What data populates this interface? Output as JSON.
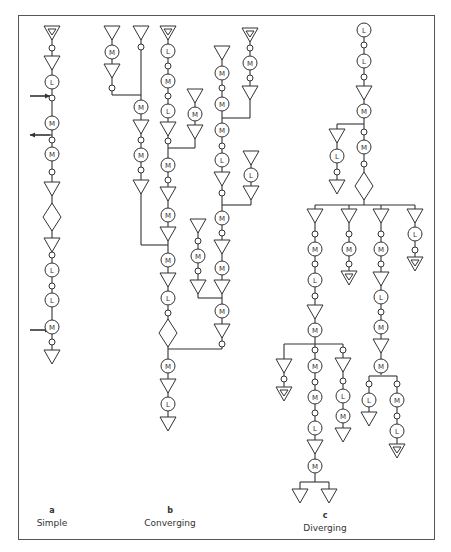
{
  "figure": {
    "panels": [
      {
        "id": "a",
        "letter": "a",
        "title": "Simple"
      },
      {
        "id": "b",
        "letter": "b",
        "title": "Converging"
      },
      {
        "id": "c",
        "letter": "c",
        "title": "Diverging"
      }
    ],
    "legend_symbols": {
      "M": "circle labeled M",
      "L": "circle labeled L",
      "triangle": "inverted triangle (storage)",
      "triangle_double": "inverted triangle with inner triangle",
      "diamond": "diamond (inspection)",
      "small_circle": "small circle (transport)",
      "arrow_in": "arrow entering line",
      "arrow_out": "arrow leaving line"
    }
  },
  "captions": {
    "a_letter": "a",
    "a_title": "Simple",
    "b_letter": "b",
    "b_title": "Converging",
    "c_letter": "c",
    "c_title": "Diverging"
  },
  "nodes": [
    {
      "t": "T2",
      "x": 52,
      "y": 32
    },
    {
      "t": "o",
      "x": 52,
      "y": 48
    },
    {
      "t": "T",
      "x": 52,
      "y": 62
    },
    {
      "t": "L",
      "x": 52,
      "y": 82
    },
    {
      "t": "o",
      "x": 52,
      "y": 98
    },
    {
      "t": "M",
      "x": 52,
      "y": 123
    },
    {
      "t": "o",
      "x": 52,
      "y": 140
    },
    {
      "t": "M",
      "x": 52,
      "y": 154
    },
    {
      "t": "o",
      "x": 52,
      "y": 172
    },
    {
      "t": "T",
      "x": 52,
      "y": 188
    },
    {
      "t": "D",
      "x": 52,
      "y": 217
    },
    {
      "t": "T",
      "x": 52,
      "y": 244
    },
    {
      "t": "o",
      "x": 52,
      "y": 255
    },
    {
      "t": "L",
      "x": 52,
      "y": 270
    },
    {
      "t": "o",
      "x": 52,
      "y": 286
    },
    {
      "t": "L",
      "x": 52,
      "y": 300
    },
    {
      "t": "M",
      "x": 52,
      "y": 327
    },
    {
      "t": "o",
      "x": 52,
      "y": 342
    },
    {
      "t": "T",
      "x": 52,
      "y": 356
    },
    {
      "t": "T",
      "x": 112,
      "y": 32
    },
    {
      "t": "M",
      "x": 112,
      "y": 52
    },
    {
      "t": "T",
      "x": 112,
      "y": 70
    },
    {
      "t": "o",
      "x": 112,
      "y": 88
    },
    {
      "t": "T",
      "x": 141,
      "y": 32
    },
    {
      "t": "o",
      "x": 141,
      "y": 47
    },
    {
      "t": "M",
      "x": 141,
      "y": 107
    },
    {
      "t": "T",
      "x": 141,
      "y": 126
    },
    {
      "t": "o",
      "x": 141,
      "y": 140
    },
    {
      "t": "M",
      "x": 141,
      "y": 155
    },
    {
      "t": "o",
      "x": 141,
      "y": 170
    },
    {
      "t": "T",
      "x": 141,
      "y": 186
    },
    {
      "t": "T2",
      "x": 168,
      "y": 32
    },
    {
      "t": "L",
      "x": 168,
      "y": 51
    },
    {
      "t": "o",
      "x": 168,
      "y": 66
    },
    {
      "t": "M",
      "x": 168,
      "y": 81
    },
    {
      "t": "o",
      "x": 168,
      "y": 96
    },
    {
      "t": "L",
      "x": 168,
      "y": 111
    },
    {
      "t": "T",
      "x": 168,
      "y": 128
    },
    {
      "t": "o",
      "x": 168,
      "y": 141
    },
    {
      "t": "M",
      "x": 168,
      "y": 165
    },
    {
      "t": "o",
      "x": 168,
      "y": 180
    },
    {
      "t": "T",
      "x": 168,
      "y": 193
    },
    {
      "t": "M",
      "x": 168,
      "y": 215
    },
    {
      "t": "T",
      "x": 168,
      "y": 233
    },
    {
      "t": "M",
      "x": 168,
      "y": 260
    },
    {
      "t": "T",
      "x": 168,
      "y": 279
    },
    {
      "t": "L",
      "x": 168,
      "y": 298
    },
    {
      "t": "o",
      "x": 168,
      "y": 313
    },
    {
      "t": "D",
      "x": 168,
      "y": 333
    },
    {
      "t": "M",
      "x": 168,
      "y": 366
    },
    {
      "t": "T",
      "x": 168,
      "y": 385
    },
    {
      "t": "L",
      "x": 168,
      "y": 404
    },
    {
      "t": "T",
      "x": 168,
      "y": 423
    },
    {
      "t": "T",
      "x": 195,
      "y": 95
    },
    {
      "t": "M",
      "x": 195,
      "y": 114
    },
    {
      "t": "T",
      "x": 195,
      "y": 131
    },
    {
      "t": "T",
      "x": 198,
      "y": 225
    },
    {
      "t": "o",
      "x": 198,
      "y": 241
    },
    {
      "t": "M",
      "x": 198,
      "y": 256
    },
    {
      "t": "o",
      "x": 198,
      "y": 271
    },
    {
      "t": "T",
      "x": 198,
      "y": 286
    },
    {
      "t": "T",
      "x": 222,
      "y": 52
    },
    {
      "t": "M",
      "x": 222,
      "y": 73
    },
    {
      "t": "o",
      "x": 222,
      "y": 88
    },
    {
      "t": "M",
      "x": 222,
      "y": 104
    },
    {
      "t": "M",
      "x": 222,
      "y": 130
    },
    {
      "t": "o",
      "x": 222,
      "y": 146
    },
    {
      "t": "L",
      "x": 222,
      "y": 160
    },
    {
      "t": "T",
      "x": 222,
      "y": 178
    },
    {
      "t": "o",
      "x": 222,
      "y": 193
    },
    {
      "t": "M",
      "x": 222,
      "y": 218
    },
    {
      "t": "o",
      "x": 222,
      "y": 233
    },
    {
      "t": "T",
      "x": 222,
      "y": 246
    },
    {
      "t": "M",
      "x": 222,
      "y": 268
    },
    {
      "t": "T",
      "x": 222,
      "y": 286
    },
    {
      "t": "M",
      "x": 222,
      "y": 311
    },
    {
      "t": "T",
      "x": 222,
      "y": 330
    },
    {
      "t": "o",
      "x": 222,
      "y": 344
    },
    {
      "t": "T2",
      "x": 250,
      "y": 34
    },
    {
      "t": "o",
      "x": 250,
      "y": 48
    },
    {
      "t": "M",
      "x": 250,
      "y": 63
    },
    {
      "t": "o",
      "x": 250,
      "y": 78
    },
    {
      "t": "T",
      "x": 250,
      "y": 92
    },
    {
      "t": "T",
      "x": 251,
      "y": 157
    },
    {
      "t": "L",
      "x": 251,
      "y": 175
    },
    {
      "t": "T",
      "x": 251,
      "y": 192
    },
    {
      "t": "L",
      "x": 364,
      "y": 30
    },
    {
      "t": "o",
      "x": 364,
      "y": 45
    },
    {
      "t": "L",
      "x": 364,
      "y": 61
    },
    {
      "t": "o",
      "x": 364,
      "y": 77
    },
    {
      "t": "T",
      "x": 364,
      "y": 92
    },
    {
      "t": "M",
      "x": 364,
      "y": 111
    },
    {
      "t": "o",
      "x": 364,
      "y": 132
    },
    {
      "t": "M",
      "x": 364,
      "y": 147
    },
    {
      "t": "o",
      "x": 364,
      "y": 164
    },
    {
      "t": "D",
      "x": 364,
      "y": 186
    },
    {
      "t": "T",
      "x": 337,
      "y": 135
    },
    {
      "t": "L",
      "x": 337,
      "y": 156
    },
    {
      "t": "o",
      "x": 337,
      "y": 172
    },
    {
      "t": "T",
      "x": 337,
      "y": 186
    },
    {
      "t": "T",
      "x": 315,
      "y": 215
    },
    {
      "t": "o",
      "x": 315,
      "y": 234
    },
    {
      "t": "M",
      "x": 315,
      "y": 249
    },
    {
      "t": "o",
      "x": 315,
      "y": 264
    },
    {
      "t": "L",
      "x": 315,
      "y": 280
    },
    {
      "t": "o",
      "x": 315,
      "y": 296
    },
    {
      "t": "T",
      "x": 315,
      "y": 311
    },
    {
      "t": "M",
      "x": 315,
      "y": 330
    },
    {
      "t": "T",
      "x": 284,
      "y": 365
    },
    {
      "t": "o",
      "x": 284,
      "y": 379
    },
    {
      "t": "T2",
      "x": 284,
      "y": 393
    },
    {
      "t": "o",
      "x": 315,
      "y": 350
    },
    {
      "t": "M",
      "x": 315,
      "y": 366
    },
    {
      "t": "o",
      "x": 315,
      "y": 382
    },
    {
      "t": "M",
      "x": 315,
      "y": 397
    },
    {
      "t": "o",
      "x": 315,
      "y": 413
    },
    {
      "t": "L",
      "x": 315,
      "y": 428
    },
    {
      "t": "T",
      "x": 315,
      "y": 446
    },
    {
      "t": "M",
      "x": 315,
      "y": 466
    },
    {
      "t": "T",
      "x": 300,
      "y": 495
    },
    {
      "t": "T",
      "x": 329,
      "y": 495
    },
    {
      "t": "o",
      "x": 343,
      "y": 350
    },
    {
      "t": "T",
      "x": 343,
      "y": 364
    },
    {
      "t": "o",
      "x": 343,
      "y": 381
    },
    {
      "t": "L",
      "x": 343,
      "y": 396
    },
    {
      "t": "M",
      "x": 343,
      "y": 416
    },
    {
      "t": "T",
      "x": 343,
      "y": 434
    },
    {
      "t": "T",
      "x": 349,
      "y": 215
    },
    {
      "t": "o",
      "x": 349,
      "y": 234
    },
    {
      "t": "M",
      "x": 349,
      "y": 249
    },
    {
      "t": "o",
      "x": 349,
      "y": 264
    },
    {
      "t": "T2",
      "x": 349,
      "y": 277
    },
    {
      "t": "T",
      "x": 381,
      "y": 215
    },
    {
      "t": "o",
      "x": 381,
      "y": 234
    },
    {
      "t": "M",
      "x": 381,
      "y": 249
    },
    {
      "t": "o",
      "x": 381,
      "y": 264
    },
    {
      "t": "T",
      "x": 381,
      "y": 278
    },
    {
      "t": "L",
      "x": 381,
      "y": 297
    },
    {
      "t": "o",
      "x": 381,
      "y": 312
    },
    {
      "t": "M",
      "x": 381,
      "y": 327
    },
    {
      "t": "T",
      "x": 381,
      "y": 345
    },
    {
      "t": "M",
      "x": 381,
      "y": 366
    },
    {
      "t": "o",
      "x": 369,
      "y": 384
    },
    {
      "t": "L",
      "x": 369,
      "y": 400
    },
    {
      "t": "T",
      "x": 369,
      "y": 418
    },
    {
      "t": "o",
      "x": 397,
      "y": 384
    },
    {
      "t": "M",
      "x": 397,
      "y": 400
    },
    {
      "t": "o",
      "x": 397,
      "y": 416
    },
    {
      "t": "L",
      "x": 397,
      "y": 431
    },
    {
      "t": "T2",
      "x": 397,
      "y": 450
    },
    {
      "t": "T",
      "x": 415,
      "y": 215
    },
    {
      "t": "L",
      "x": 415,
      "y": 234
    },
    {
      "t": "o",
      "x": 415,
      "y": 250
    },
    {
      "t": "T2",
      "x": 415,
      "y": 263
    }
  ],
  "lines": [
    [
      52,
      26,
      52,
      362
    ],
    [
      30,
      96,
      52,
      96
    ],
    [
      30,
      135,
      52,
      135
    ],
    [
      30,
      330,
      52,
      330
    ],
    [
      112,
      26,
      112,
      95
    ],
    [
      112,
      95,
      141,
      95
    ],
    [
      141,
      26,
      141,
      192
    ],
    [
      168,
      26,
      168,
      429
    ],
    [
      168,
      148,
      195,
      148
    ],
    [
      195,
      89,
      195,
      148
    ],
    [
      141,
      245,
      168,
      245
    ],
    [
      141,
      192,
      141,
      245
    ],
    [
      168,
      349,
      222,
      349
    ],
    [
      198,
      219,
      198,
      298
    ],
    [
      198,
      298,
      222,
      298
    ],
    [
      222,
      46,
      222,
      349
    ],
    [
      222,
      118,
      250,
      118
    ],
    [
      250,
      28,
      250,
      118
    ],
    [
      222,
      205,
      251,
      205
    ],
    [
      251,
      151,
      251,
      205
    ],
    [
      364,
      24,
      364,
      205
    ],
    [
      337,
      124,
      364,
      124
    ],
    [
      337,
      124,
      337,
      192
    ],
    [
      315,
      205,
      415,
      205
    ],
    [
      315,
      205,
      315,
      482
    ],
    [
      349,
      205,
      349,
      283
    ],
    [
      381,
      205,
      381,
      375
    ],
    [
      415,
      205,
      415,
      269
    ],
    [
      284,
      344,
      343,
      344
    ],
    [
      284,
      344,
      284,
      399
    ],
    [
      343,
      344,
      343,
      440
    ],
    [
      300,
      482,
      329,
      482
    ],
    [
      300,
      482,
      300,
      489
    ],
    [
      329,
      482,
      329,
      489
    ],
    [
      369,
      376,
      397,
      376
    ],
    [
      369,
      376,
      369,
      424
    ],
    [
      397,
      376,
      397,
      456
    ]
  ],
  "arrows": [
    {
      "dir": "in",
      "x1": 30,
      "y1": 96,
      "x2": 50,
      "y2": 96
    },
    {
      "dir": "out",
      "x1": 50,
      "y1": 135,
      "x2": 30,
      "y2": 135
    },
    {
      "dir": "in",
      "x1": 30,
      "y1": 330,
      "x2": 50,
      "y2": 330
    }
  ]
}
